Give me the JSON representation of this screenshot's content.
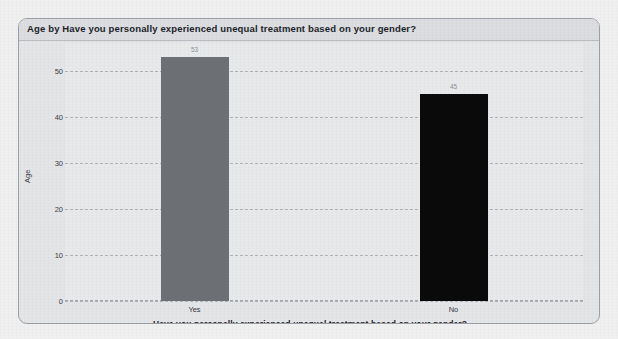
{
  "chart_data": {
    "type": "bar",
    "title": "Age by Have you personally experienced unequal treatment based on your gender?",
    "xlabel": "Have you personally experienced unequal treatment based on your gender?",
    "ylabel": "Age",
    "categories": [
      "Yes",
      "No"
    ],
    "values": [
      53,
      45
    ],
    "value_labels": [
      "53",
      "45"
    ],
    "bar_colors": [
      "#6d7175",
      "#0a0a0a"
    ],
    "yticks": [
      0,
      10,
      20,
      30,
      40,
      50
    ],
    "ytick_labels": [
      "0",
      "10",
      "20",
      "30",
      "40",
      "50"
    ],
    "ylim": [
      0,
      56
    ],
    "grid": true,
    "legend": "none"
  },
  "card": {
    "background": "#e4e5e7",
    "border_color": "#9aa0a6"
  },
  "page": {
    "background": "#f0f0f0"
  }
}
